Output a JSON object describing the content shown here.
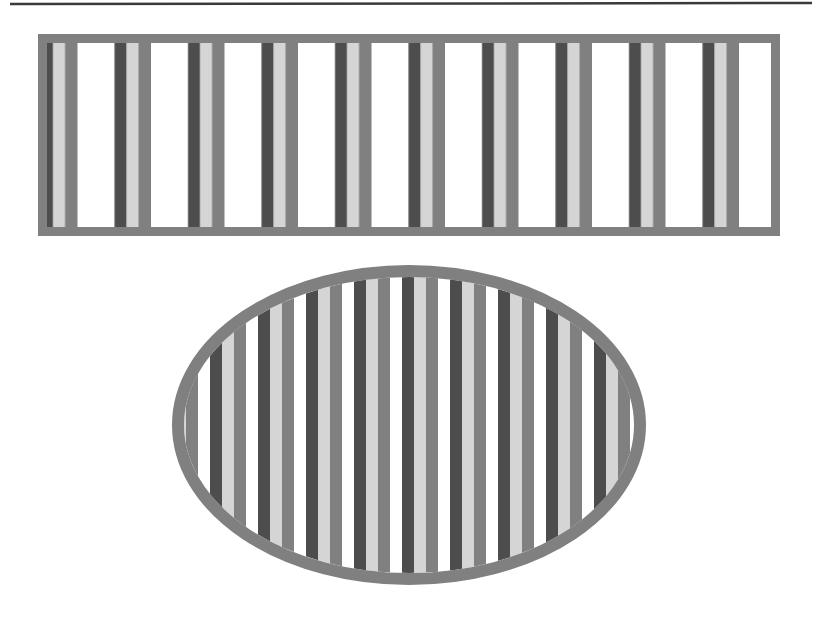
{
  "figure": {
    "canvas": {
      "width": 817,
      "height": 617,
      "background": "#ffffff"
    },
    "palette": {
      "rule_line": "#3a3a3a",
      "outline_gray": "#808080",
      "stripe_dark": "#4d4d4d",
      "stripe_light": "#d5d5d5",
      "stripe_mid": "#808080",
      "stripe_white": "#ffffff"
    },
    "elements": [
      {
        "name": "top-rule-line",
        "type": "line",
        "x1": 10,
        "y1": 4,
        "x2": 812,
        "y2": 3,
        "stroke": "#3a3a3a",
        "stroke_width": 2.5
      },
      {
        "name": "striped-rectangle",
        "type": "rectangle",
        "x": 38,
        "y": 34,
        "width": 742,
        "height": 202,
        "outline_color": "#808080",
        "outline_width": 9,
        "fill": "#ffffff",
        "stripe_pattern": {
          "period": 73.5,
          "offset": 4,
          "bands": [
            {
              "color": "#ffffff",
              "width": 37
            },
            {
              "color": "#4d4d4d",
              "width": 12
            },
            {
              "color": "#d5d5d5",
              "width": 12
            },
            {
              "color": "#808080",
              "width": 12.5
            }
          ],
          "orientation": "vertical",
          "repeat_count": 10
        }
      },
      {
        "name": "striped-ellipse",
        "type": "ellipse",
        "cx": 409,
        "cy": 425,
        "rx": 237,
        "ry": 160,
        "outline_color": "#808080",
        "outline_width": 12,
        "fill": "#ffffff",
        "stripe_pattern": {
          "period": 48,
          "offset": 6,
          "bands": [
            {
              "color": "#ffffff",
              "width": 12
            },
            {
              "color": "#4d4d4d",
              "width": 12
            },
            {
              "color": "#d5d5d5",
              "width": 12
            },
            {
              "color": "#808080",
              "width": 12
            }
          ],
          "orientation": "vertical",
          "repeat_count": 10
        }
      }
    ]
  }
}
